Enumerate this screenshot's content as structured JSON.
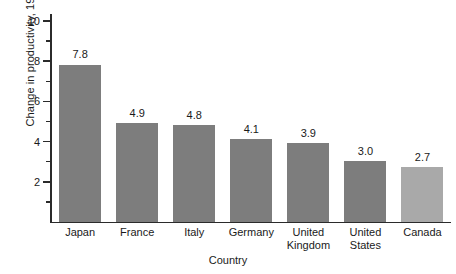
{
  "chart_data": {
    "type": "bar",
    "title": "",
    "xlabel": "Country",
    "ylabel": "Change in productivity, 1960–1990 (%)",
    "categories": [
      "Japan",
      "France",
      "Italy",
      "Germany",
      "United Kingdom",
      "United States",
      "Canada"
    ],
    "values": [
      7.8,
      4.9,
      4.8,
      4.1,
      3.9,
      3.0,
      2.7
    ],
    "value_labels": [
      "7.8",
      "4.9",
      "4.8",
      "4.1",
      "3.9",
      "3.0",
      "2.7"
    ],
    "ylim": [
      0,
      10.6
    ],
    "ytick_values": [
      2,
      4,
      6,
      8,
      10
    ],
    "ytick_labels": [
      "2",
      "4",
      "6",
      "8",
      "10"
    ],
    "yminor_tick_values": [
      1,
      3,
      5,
      7,
      9
    ],
    "grid": false,
    "legend": null,
    "bar_color": "#7d7d7d",
    "bar_color_last": "#a9a9a9",
    "axis_color": "#2b2b2b"
  },
  "axes": {
    "y_title": "Change in productivity, 1960–1990 (%)",
    "x_title": "Country"
  },
  "categories": [
    {
      "label_line1": "Japan",
      "label_line2": ""
    },
    {
      "label_line1": "France",
      "label_line2": ""
    },
    {
      "label_line1": "Italy",
      "label_line2": ""
    },
    {
      "label_line1": "Germany",
      "label_line2": ""
    },
    {
      "label_line1": "United",
      "label_line2": "Kingdom"
    },
    {
      "label_line1": "United",
      "label_line2": "States"
    },
    {
      "label_line1": "Canada",
      "label_line2": ""
    }
  ],
  "bars": [
    {
      "value_label": "7.8"
    },
    {
      "value_label": "4.9"
    },
    {
      "value_label": "4.8"
    },
    {
      "value_label": "4.1"
    },
    {
      "value_label": "3.9"
    },
    {
      "value_label": "3.0"
    },
    {
      "value_label": "2.7"
    }
  ],
  "yticks": [
    {
      "label": "2"
    },
    {
      "label": "4"
    },
    {
      "label": "6"
    },
    {
      "label": "8"
    },
    {
      "label": "10"
    }
  ]
}
